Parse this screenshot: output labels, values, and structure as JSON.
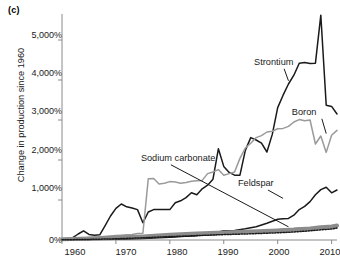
{
  "panel": {
    "label": "(c)"
  },
  "chart_data": {
    "type": "line",
    "title": "",
    "subtitle": "",
    "xlabel": "",
    "ylabel": "Change in production since 1960",
    "xlim": [
      1960,
      2011
    ],
    "ylim": [
      0,
      5700
    ],
    "xticks": [
      1960,
      1970,
      1980,
      1990,
      2000,
      2010
    ],
    "xtick_labels": [
      "1960",
      "1970",
      "1980",
      "1990",
      "2000",
      "2010"
    ],
    "yticks": [
      0,
      1000,
      2000,
      3000,
      4000,
      5000
    ],
    "ytick_labels": [
      "0%",
      "1,000%",
      "2,000%",
      "3,000%",
      "4,000%",
      "5,000%"
    ],
    "grid": false,
    "legend_position": "annotations-on-plot",
    "annotations": [
      {
        "text": "Strontium",
        "x": 1996,
        "y": 4430,
        "leader_to_x": 2002,
        "leader_to_y": 3980
      },
      {
        "text": "Boron",
        "x": 2003,
        "y": 3180,
        "leader_to_x": 2009,
        "leader_to_y": 2660
      },
      {
        "text": "Sodium carbonate",
        "x": 1975,
        "y": 2030,
        "leader_to_x": 2002,
        "leader_to_y": 330
      },
      {
        "text": "Feldspar",
        "x": 1993,
        "y": 1400,
        "leader_to_x": 2001,
        "leader_to_y": 1040
      }
    ],
    "series": [
      {
        "name": "Strontium",
        "color": "#1a1a1a",
        "style": "solid",
        "width": 1.5,
        "x": [
          1960,
          1961,
          1962,
          1963,
          1964,
          1965,
          1966,
          1967,
          1968,
          1969,
          1970,
          1971,
          1972,
          1973,
          1974,
          1975,
          1976,
          1977,
          1978,
          1979,
          1980,
          1981,
          1982,
          1983,
          1984,
          1985,
          1986,
          1987,
          1988,
          1989,
          1990,
          1991,
          1992,
          1993,
          1994,
          1995,
          1996,
          1997,
          1998,
          1999,
          2000,
          2001,
          2002,
          2003,
          2004,
          2005,
          2006,
          2007,
          2008,
          2009,
          2010,
          2011
        ],
        "values": [
          0,
          20,
          60,
          150,
          230,
          140,
          120,
          130,
          360,
          600,
          790,
          900,
          830,
          800,
          760,
          430,
          700,
          760,
          760,
          760,
          760,
          930,
          980,
          1060,
          1180,
          1130,
          1280,
          1370,
          1520,
          2280,
          1840,
          1690,
          1620,
          1620,
          2240,
          2560,
          2500,
          2420,
          2200,
          2640,
          3310,
          3620,
          3900,
          4120,
          4420,
          4440,
          4410,
          4420,
          5620,
          3370,
          3340,
          3150
        ]
      },
      {
        "name": "Boron",
        "color": "#9a9a9a",
        "style": "solid",
        "width": 1.5,
        "x": [
          1960,
          1961,
          1962,
          1963,
          1964,
          1965,
          1966,
          1967,
          1968,
          1969,
          1970,
          1971,
          1972,
          1973,
          1974,
          1975,
          1976,
          1977,
          1978,
          1979,
          1980,
          1981,
          1982,
          1983,
          1984,
          1985,
          1986,
          1987,
          1988,
          1989,
          1990,
          1991,
          1992,
          1993,
          1994,
          1995,
          1996,
          1997,
          1998,
          1999,
          2000,
          2001,
          2002,
          2003,
          2004,
          2005,
          2006,
          2007,
          2008,
          2009,
          2010,
          2011
        ],
        "values": [
          0,
          10,
          30,
          40,
          50,
          60,
          70,
          80,
          90,
          100,
          110,
          120,
          130,
          140,
          160,
          170,
          1530,
          1540,
          1400,
          1420,
          1460,
          1450,
          1420,
          1440,
          1470,
          1480,
          1490,
          1660,
          1700,
          1760,
          1620,
          1660,
          1700,
          2040,
          2300,
          2420,
          2560,
          2610,
          2700,
          2720,
          2780,
          2790,
          2840,
          2950,
          3010,
          2980,
          3000,
          2400,
          2600,
          2190,
          2620,
          2740
        ]
      },
      {
        "name": "Sodium carbonate",
        "color": "#1a1a1a",
        "style": "solid",
        "width": 1.3,
        "x": [
          1960,
          1965,
          1970,
          1975,
          1980,
          1985,
          1990,
          1995,
          2000,
          2005,
          2011
        ],
        "values": [
          0,
          20,
          40,
          60,
          80,
          110,
          150,
          200,
          260,
          300,
          330
        ]
      },
      {
        "name": "Feldspar",
        "color": "#1a1a1a",
        "style": "solid",
        "width": 1.5,
        "x": [
          1960,
          1965,
          1970,
          1975,
          1980,
          1985,
          1988,
          1990,
          1992,
          1994,
          1996,
          1998,
          2000,
          2001,
          2002,
          2003,
          2004,
          2005,
          2006,
          2007,
          2008,
          2009,
          2010,
          2011
        ],
        "values": [
          0,
          10,
          20,
          40,
          70,
          110,
          160,
          230,
          240,
          280,
          330,
          420,
          520,
          530,
          540,
          620,
          760,
          840,
          960,
          1130,
          1260,
          1320,
          1180,
          1250
        ]
      },
      {
        "name": "unlabeled-thick-gray",
        "color": "#8c8c8c",
        "style": "solid",
        "width": 4,
        "x": [
          1960,
          1965,
          1970,
          1975,
          1980,
          1985,
          1990,
          1995,
          2000,
          2003,
          2006,
          2008,
          2010,
          2011
        ],
        "values": [
          20,
          40,
          60,
          90,
          130,
          160,
          190,
          210,
          240,
          260,
          290,
          320,
          340,
          360
        ]
      },
      {
        "name": "unlabeled-dotted-black",
        "color": "#1a1a1a",
        "style": "dotted",
        "width": 1.5,
        "x": [
          1960,
          1965,
          1970,
          1975,
          1980,
          1985,
          1990,
          1995,
          2000,
          2003,
          2006,
          2008,
          2010,
          2011
        ],
        "values": [
          5,
          15,
          30,
          55,
          85,
          110,
          135,
          155,
          180,
          200,
          230,
          255,
          275,
          300
        ]
      }
    ]
  }
}
